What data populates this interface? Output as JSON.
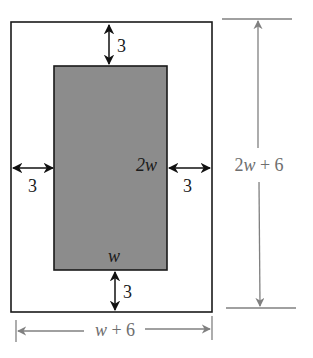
{
  "diagram": {
    "type": "geometry-dimensioned-rectangles",
    "colors": {
      "background": "#ffffff",
      "outer_stroke": "#1a1a1a",
      "inner_fill": "#8c8c8c",
      "inner_stroke": "#1a1a1a",
      "margin_arrows": "#111111",
      "dimension_lines": "#808080",
      "dimension_text": "#6e6e6e",
      "label_text": "#1a1a1a"
    },
    "outer_rect": {
      "width_label": "w + 6",
      "height_label": "2w + 6"
    },
    "inner_rect": {
      "width_label": "w",
      "height_label": "2w"
    },
    "margins": {
      "top": "3",
      "bottom": "3",
      "left": "3",
      "right": "3"
    }
  }
}
